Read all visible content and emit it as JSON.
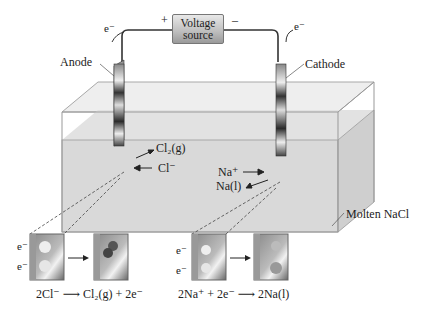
{
  "diagram": {
    "voltage_source": {
      "line1": "Voltage",
      "line2": "source",
      "plus": "+",
      "minus": "–"
    },
    "electron_labels": {
      "left_top": "e⁻",
      "right_top": "e⁻"
    },
    "electrodes": {
      "anode": "Anode",
      "cathode": "Cathode"
    },
    "species": {
      "cl2": "Cl₂(g)",
      "cl_minus": "Cl⁻",
      "na_plus": "Na⁺",
      "na_liquid": "Na(l)"
    },
    "electrolyte": "Molten NaCl",
    "insets": {
      "anode_reaction": "2Cl⁻ ⟶ Cl₂(g) + 2e⁻",
      "cathode_reaction": "2Na⁺ + 2e⁻ ⟶ 2Na(l)",
      "e_label": "e⁻"
    },
    "colors": {
      "liquid": "#d9d9d9",
      "glass_edge": "#a8a8a8",
      "electrode_dark": "#3a3a3a",
      "electrode_light": "#f0f0f0"
    }
  }
}
